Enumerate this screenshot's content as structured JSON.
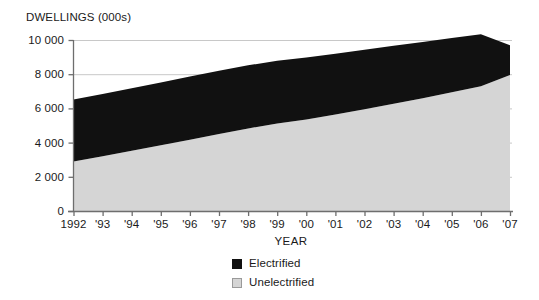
{
  "chart_data": {
    "type": "area",
    "stacked": true,
    "title": "",
    "ylabel": "DWELLINGS (000s)",
    "xlabel": "YEAR",
    "ylim": [
      0,
      10000
    ],
    "yticks": [
      0,
      2000,
      4000,
      6000,
      8000,
      10000
    ],
    "ytick_labels": [
      "0",
      "2 000",
      "4 000",
      "6 000",
      "8 000",
      "10 000"
    ],
    "grid": "horizontal-light",
    "legend_position": "bottom-center",
    "categories": [
      "1992",
      "1993",
      "1994",
      "1995",
      "1996",
      "1997",
      "1998",
      "1999",
      "2000",
      "2001",
      "2002",
      "2003",
      "2004",
      "2005",
      "2006",
      "2007"
    ],
    "xtick_labels": [
      "1992",
      "'93",
      "'94",
      "'95",
      "'96",
      "'97",
      "'98",
      "'99",
      "'00",
      "'01",
      "'02",
      "'03",
      "'04",
      "'05",
      "'06",
      "'07"
    ],
    "series": [
      {
        "name": "Unelectrified",
        "color": "#d5d5d5",
        "values": [
          2900,
          3200,
          3520,
          3840,
          4170,
          4500,
          4830,
          5120,
          5350,
          5640,
          5950,
          6270,
          6600,
          6950,
          7300,
          7950
        ]
      },
      {
        "name": "Electrified",
        "color": "#111111",
        "values": [
          3620,
          3640,
          3660,
          3680,
          3700,
          3700,
          3690,
          3660,
          3630,
          3560,
          3480,
          3390,
          3290,
          3160,
          3030,
          1750
        ]
      }
    ],
    "stack_totals": [
      6520,
      6840,
      7180,
      7520,
      7870,
      8200,
      8520,
      8780,
      8980,
      9200,
      9430,
      9660,
      9890,
      10110,
      10330,
      9700
    ]
  },
  "legend": {
    "items": [
      {
        "label": "Electrified",
        "color": "#111111",
        "swatch": "filled-black"
      },
      {
        "label": "Unelectrified",
        "color": "#d5d5d5",
        "swatch": "filled-grey"
      }
    ]
  },
  "colors": {
    "electrified": "#111111",
    "unelectrified": "#d5d5d5",
    "axis": "#6e6e6e",
    "grid": "#c8c8c8",
    "text": "#1a1a1a",
    "background": "#ffffff"
  }
}
